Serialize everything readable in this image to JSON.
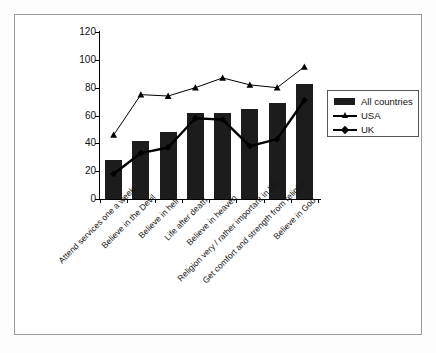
{
  "chart_data": {
    "type": "bar",
    "title": "",
    "subtitle": "",
    "xlabel": "",
    "ylabel": "",
    "ylim": [
      0,
      120
    ],
    "yticks": [
      0,
      20,
      40,
      60,
      80,
      100,
      120
    ],
    "grid": false,
    "legend_position": "right",
    "categories": [
      "Attend services one a week",
      "Believe in the Devil",
      "Believe in hell",
      "Life after death",
      "Believe in heaven",
      "Religion very / rather important in life",
      "Get comfort and strength from religion",
      "Believe in God"
    ],
    "series": [
      {
        "name": "All countries",
        "type": "bar",
        "marker": "none",
        "color": "#1c1c1c",
        "values": [
          28,
          42,
          48,
          62,
          62,
          65,
          69,
          83
        ]
      },
      {
        "name": "USA",
        "type": "line",
        "marker": "triangle",
        "color": "#000000",
        "values": [
          46,
          75,
          74,
          80,
          87,
          82,
          80,
          95
        ]
      },
      {
        "name": "UK",
        "type": "line",
        "marker": "diamond",
        "color": "#000000",
        "values": [
          18,
          33,
          37,
          58,
          57,
          38,
          43,
          71
        ]
      }
    ]
  },
  "legend": {
    "items": [
      {
        "label": "All countries",
        "key": "bar-swatch"
      },
      {
        "label": "USA",
        "key": "line-triangle-marker"
      },
      {
        "label": "UK",
        "key": "line-diamond-marker"
      }
    ]
  },
  "axis": {
    "y_tick_labels": [
      "120",
      "100",
      "80",
      "60",
      "40",
      "20",
      "0"
    ]
  }
}
